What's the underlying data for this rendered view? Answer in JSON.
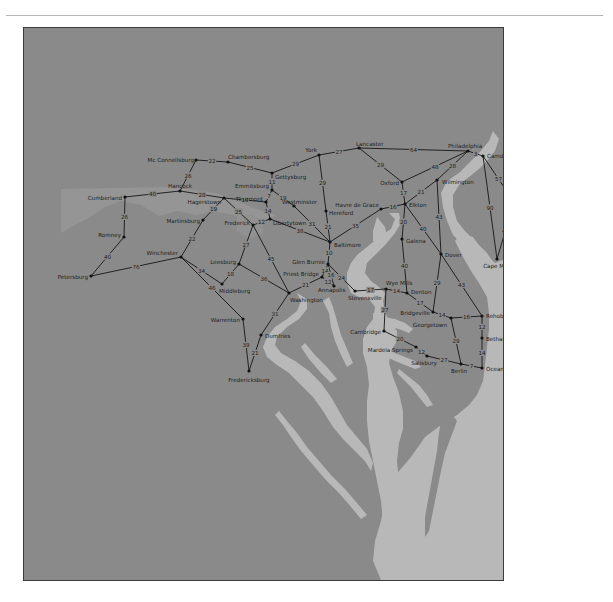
{
  "map": {
    "title": "Road distance map — Mid-Atlantic region",
    "colors": {
      "land_main": "#8a8a8a",
      "land_light": "#959595",
      "water": "#b8b8b8",
      "road": "#151515",
      "text": "#1d1d1d",
      "frame": "#3c3c3c"
    },
    "cities": [
      {
        "id": "mcconnellsburg",
        "name": "Mc Connellsburg",
        "x": 195,
        "y": 159,
        "lx": -2,
        "ly": 0,
        "anchor": "end"
      },
      {
        "id": "chamberburg",
        "name": "Chambersburg",
        "x": 227,
        "y": 161,
        "lx": 0,
        "ly": -5,
        "anchor": "start"
      },
      {
        "id": "gettysburg",
        "name": "Gettysburg",
        "x": 271,
        "y": 172,
        "lx": 3,
        "ly": 4,
        "anchor": "start"
      },
      {
        "id": "york",
        "name": "York",
        "x": 318,
        "y": 154,
        "lx": -2,
        "ly": -5,
        "anchor": "end"
      },
      {
        "id": "lancaster",
        "name": "Lancaster",
        "x": 358,
        "y": 147,
        "lx": -3,
        "ly": -4,
        "anchor": "start"
      },
      {
        "id": "philadelphia",
        "name": "Philadelphia",
        "x": 467,
        "y": 150,
        "lx": -20,
        "ly": -5,
        "anchor": "start"
      },
      {
        "id": "camden",
        "name": "Camden",
        "x": 482,
        "y": 155,
        "lx": 4,
        "ly": 0,
        "anchor": "start"
      },
      {
        "id": "hancock",
        "name": "Hancock",
        "x": 179,
        "y": 190,
        "lx": -12,
        "ly": -5,
        "anchor": "start"
      },
      {
        "id": "cumberland",
        "name": "Cumberland",
        "x": 124,
        "y": 196,
        "lx": -3,
        "ly": 1,
        "anchor": "end"
      },
      {
        "id": "hagerstown",
        "name": "Hagerstown",
        "x": 223,
        "y": 197,
        "lx": -3,
        "ly": 4,
        "anchor": "end"
      },
      {
        "id": "emmitsburg",
        "name": "Emmitsburg",
        "x": 271,
        "y": 189,
        "lx": -3,
        "ly": -4,
        "anchor": "end"
      },
      {
        "id": "thurmont",
        "name": "Thurmont",
        "x": 265,
        "y": 201,
        "lx": -3,
        "ly": -3,
        "anchor": "end"
      },
      {
        "id": "westminster",
        "name": "Westminster",
        "x": 293,
        "y": 205,
        "lx": -12,
        "ly": -4,
        "anchor": "start"
      },
      {
        "id": "oxford",
        "name": "Oxford",
        "x": 401,
        "y": 181,
        "lx": -3,
        "ly": 1,
        "anchor": "end"
      },
      {
        "id": "wilmington",
        "name": "Wilmington",
        "x": 436,
        "y": 179,
        "lx": 5,
        "ly": 2,
        "anchor": "start"
      },
      {
        "id": "atlanticcity",
        "name": "Atlantic City",
        "x": 513,
        "y": 201,
        "lx": 3,
        "ly": 1,
        "anchor": "start"
      },
      {
        "id": "hereford",
        "name": "Hereford",
        "x": 325,
        "y": 210,
        "lx": 3,
        "ly": 2,
        "anchor": "start"
      },
      {
        "id": "havredegrace",
        "name": "Havre de Grace",
        "x": 380,
        "y": 208,
        "lx": -2,
        "ly": -4,
        "anchor": "end"
      },
      {
        "id": "elkton",
        "name": "Elkton",
        "x": 404,
        "y": 203,
        "lx": 4,
        "ly": 1,
        "anchor": "start"
      },
      {
        "id": "martinsburg",
        "name": "Martinsburg",
        "x": 202,
        "y": 219,
        "lx": -3,
        "ly": 1,
        "anchor": "end"
      },
      {
        "id": "frederick",
        "name": "Frederick",
        "x": 252,
        "y": 224,
        "lx": -3,
        "ly": -2,
        "anchor": "end"
      },
      {
        "id": "libertytown",
        "name": "Libertytown",
        "x": 269,
        "y": 218,
        "lx": 3,
        "ly": 4,
        "anchor": "start"
      },
      {
        "id": "romney",
        "name": "Romney",
        "x": 123,
        "y": 236,
        "lx": -3,
        "ly": -2,
        "anchor": "end"
      },
      {
        "id": "baltimore",
        "name": "Baltimore",
        "x": 329,
        "y": 241,
        "lx": 4,
        "ly": 3,
        "anchor": "start"
      },
      {
        "id": "galena",
        "name": "Galena",
        "x": 401,
        "y": 238,
        "lx": 4,
        "ly": 2,
        "anchor": "start"
      },
      {
        "id": "winchester",
        "name": "Winchester",
        "x": 180,
        "y": 256,
        "lx": -3,
        "ly": -4,
        "anchor": "end"
      },
      {
        "id": "leesburg",
        "name": "Leesburg",
        "x": 238,
        "y": 263,
        "lx": -3,
        "ly": -2,
        "anchor": "end"
      },
      {
        "id": "dover",
        "name": "Dover",
        "x": 440,
        "y": 253,
        "lx": 4,
        "ly": 1,
        "anchor": "start"
      },
      {
        "id": "glenburnie",
        "name": "Glen Burnie",
        "x": 327,
        "y": 263,
        "lx": -3,
        "ly": -2,
        "anchor": "end"
      },
      {
        "id": "petersburg",
        "name": "Petersburg",
        "x": 90,
        "y": 275,
        "lx": -3,
        "ly": 1,
        "anchor": "end"
      },
      {
        "id": "capemay",
        "name": "Cape May",
        "x": 496,
        "y": 258,
        "lx": 0,
        "ly": 7,
        "anchor": "middle"
      },
      {
        "id": "middleburg",
        "name": "Middleburg",
        "x": 221,
        "y": 283,
        "lx": -3,
        "ly": 7,
        "anchor": "start"
      },
      {
        "id": "priestbridge",
        "name": "Priest Bridge",
        "x": 321,
        "y": 276,
        "lx": -3,
        "ly": -3,
        "anchor": "end"
      },
      {
        "id": "annapolis",
        "name": "Annapolis",
        "x": 333,
        "y": 285,
        "lx": -16,
        "ly": 4,
        "anchor": "start"
      },
      {
        "id": "wyemills",
        "name": "Wye Mills",
        "x": 385,
        "y": 288,
        "lx": 0,
        "ly": -6,
        "anchor": "start"
      },
      {
        "id": "stevensville",
        "name": "Stevensville",
        "x": 354,
        "y": 290,
        "lx": -7,
        "ly": 7,
        "anchor": "start"
      },
      {
        "id": "denton",
        "name": "Denton",
        "x": 406,
        "y": 292,
        "lx": 4,
        "ly": -1,
        "anchor": "start"
      },
      {
        "id": "washington",
        "name": "Washington",
        "x": 288,
        "y": 292,
        "lx": 1,
        "ly": 7,
        "anchor": "start"
      },
      {
        "id": "bridgeville",
        "name": "Bridgeville",
        "x": 432,
        "y": 311,
        "lx": -3,
        "ly": 1,
        "anchor": "end"
      },
      {
        "id": "georgetown",
        "name": "Georgetown",
        "x": 450,
        "y": 317,
        "lx": -4,
        "ly": 7,
        "anchor": "end"
      },
      {
        "id": "rehobothbeach",
        "name": "Rehoboth Beach",
        "x": 481,
        "y": 315,
        "lx": 4,
        "ly": 0,
        "anchor": "start"
      },
      {
        "id": "warrenton",
        "name": "Warrenton",
        "x": 242,
        "y": 318,
        "lx": -3,
        "ly": 1,
        "anchor": "end"
      },
      {
        "id": "cambridge",
        "name": "Cambridge",
        "x": 383,
        "y": 330,
        "lx": -3,
        "ly": 1,
        "anchor": "end"
      },
      {
        "id": "bethanybeach",
        "name": "Bethany Beach",
        "x": 481,
        "y": 337,
        "lx": 4,
        "ly": 1,
        "anchor": "start"
      },
      {
        "id": "dumfries",
        "name": "Dumfries",
        "x": 260,
        "y": 334,
        "lx": 4,
        "ly": 1,
        "anchor": "start"
      },
      {
        "id": "mardelasprings",
        "name": "Mardela Springs",
        "x": 415,
        "y": 346,
        "lx": -3,
        "ly": 3,
        "anchor": "end"
      },
      {
        "id": "salisbury",
        "name": "Salisbury",
        "x": 426,
        "y": 355,
        "lx": -3,
        "ly": 7,
        "anchor": "middle"
      },
      {
        "id": "berlin",
        "name": "Berlin",
        "x": 460,
        "y": 363,
        "lx": -2,
        "ly": 7,
        "anchor": "middle"
      },
      {
        "id": "oceancity",
        "name": "Ocean City",
        "x": 481,
        "y": 367,
        "lx": 4,
        "ly": 1,
        "anchor": "start"
      },
      {
        "id": "fredericksburg",
        "name": "Fredericksburg",
        "x": 248,
        "y": 370,
        "lx": 0,
        "ly": 9,
        "anchor": "middle"
      }
    ],
    "roads": [
      {
        "from": "mcconnellsburg",
        "to": "chamberburg",
        "miles": "22"
      },
      {
        "from": "chamberburg",
        "to": "gettysburg",
        "miles": "25"
      },
      {
        "from": "gettysburg",
        "to": "york",
        "miles": "29"
      },
      {
        "from": "york",
        "to": "lancaster",
        "miles": "27"
      },
      {
        "from": "lancaster",
        "to": "philadelphia",
        "miles": "64"
      },
      {
        "from": "philadelphia",
        "to": "camden",
        "miles": "3"
      },
      {
        "from": "mcconnellsburg",
        "to": "hancock",
        "miles": "26"
      },
      {
        "from": "cumberland",
        "to": "hancock",
        "miles": "40"
      },
      {
        "from": "hancock",
        "to": "hagerstown",
        "miles": "28"
      },
      {
        "from": "gettysburg",
        "to": "emmitsburg",
        "miles": "11"
      },
      {
        "from": "hagerstown",
        "to": "thurmont",
        "miles": "19"
      },
      {
        "from": "emmitsburg",
        "to": "thurmont",
        "miles": "7"
      },
      {
        "from": "emmitsburg",
        "to": "westminster",
        "miles": "19"
      },
      {
        "from": "thurmont",
        "to": "libertytown",
        "miles": "14"
      },
      {
        "from": "york",
        "to": "hereford",
        "miles": "29"
      },
      {
        "from": "hereford",
        "to": "baltimore",
        "miles": "21"
      },
      {
        "from": "westminster",
        "to": "baltimore",
        "miles": "31"
      },
      {
        "from": "libertytown",
        "to": "baltimore",
        "miles": "38"
      },
      {
        "from": "lancaster",
        "to": "oxford",
        "miles": "29"
      },
      {
        "from": "oxford",
        "to": "philadelphia",
        "miles": "48"
      },
      {
        "from": "oxford",
        "to": "elkton",
        "miles": "17"
      },
      {
        "from": "wilmington",
        "to": "philadelphia",
        "miles": "28"
      },
      {
        "from": "elkton",
        "to": "wilmington",
        "miles": "21"
      },
      {
        "from": "havredegrace",
        "to": "elkton",
        "miles": "16"
      },
      {
        "from": "baltimore",
        "to": "havredegrace",
        "miles": "35"
      },
      {
        "from": "camden",
        "to": "atlanticcity",
        "miles": "57"
      },
      {
        "from": "camden",
        "to": "capemay",
        "miles": "90"
      },
      {
        "from": "atlanticcity",
        "to": "capemay",
        "miles": "43"
      },
      {
        "from": "cumberland",
        "to": "romney",
        "miles": "26"
      },
      {
        "from": "hagerstown",
        "to": "martinsburg",
        "miles": "19"
      },
      {
        "from": "hagerstown",
        "to": "frederick",
        "miles": "25"
      },
      {
        "from": "frederick",
        "to": "libertytown",
        "miles": "12"
      },
      {
        "from": "romney",
        "to": "petersburg",
        "miles": "40"
      },
      {
        "from": "martinsburg",
        "to": "winchester",
        "miles": "22"
      },
      {
        "from": "petersburg",
        "to": "winchester",
        "miles": "76"
      },
      {
        "from": "frederick",
        "to": "leesburg",
        "miles": "27"
      },
      {
        "from": "frederick",
        "to": "washington",
        "miles": "45"
      },
      {
        "from": "winchester",
        "to": "middleburg",
        "miles": "34"
      },
      {
        "from": "leesburg",
        "to": "middleburg",
        "miles": "18"
      },
      {
        "from": "leesburg",
        "to": "washington",
        "miles": "36"
      },
      {
        "from": "winchester",
        "to": "warrenton",
        "miles": "46"
      },
      {
        "from": "elkton",
        "to": "galena",
        "miles": "20"
      },
      {
        "from": "elkton",
        "to": "dover",
        "miles": "40"
      },
      {
        "from": "wilmington",
        "to": "dover",
        "miles": "43"
      },
      {
        "from": "galena",
        "to": "denton",
        "miles": "40"
      },
      {
        "from": "baltimore",
        "to": "glenburnie",
        "miles": "10"
      },
      {
        "from": "glenburnie",
        "to": "priestbridge",
        "miles": "14"
      },
      {
        "from": "glenburnie",
        "to": "annapolis",
        "miles": "16"
      },
      {
        "from": "glenburnie",
        "to": "stevensville",
        "miles": "24"
      },
      {
        "from": "priestbridge",
        "to": "annapolis",
        "miles": "12"
      },
      {
        "from": "washington",
        "to": "priestbridge",
        "miles": "21"
      },
      {
        "from": "stevensville",
        "to": "wyemills",
        "miles": "17"
      },
      {
        "from": "wyemills",
        "to": "denton",
        "miles": "14"
      },
      {
        "from": "denton",
        "to": "bridgeville",
        "miles": "17"
      },
      {
        "from": "dover",
        "to": "bridgeville",
        "miles": "29"
      },
      {
        "from": "dover",
        "to": "rehobothbeach",
        "miles": "43"
      },
      {
        "from": "bridgeville",
        "to": "georgetown",
        "miles": "14"
      },
      {
        "from": "georgetown",
        "to": "rehobothbeach",
        "miles": "16"
      },
      {
        "from": "rehobothbeach",
        "to": "bethanybeach",
        "miles": "12"
      },
      {
        "from": "bethanybeach",
        "to": "oceancity",
        "miles": "14"
      },
      {
        "from": "wyemills",
        "to": "cambridge",
        "miles": "27"
      },
      {
        "from": "cambridge",
        "to": "mardelasprings",
        "miles": "20"
      },
      {
        "from": "mardelasprings",
        "to": "salisbury",
        "miles": "12"
      },
      {
        "from": "salisbury",
        "to": "berlin",
        "miles": "27"
      },
      {
        "from": "georgetown",
        "to": "berlin",
        "miles": "29"
      },
      {
        "from": "berlin",
        "to": "oceancity",
        "miles": "7"
      },
      {
        "from": "washington",
        "to": "dumfries",
        "miles": "31"
      },
      {
        "from": "dumfries",
        "to": "fredericksburg",
        "miles": "21"
      },
      {
        "from": "warrenton",
        "to": "fredericksburg",
        "miles": "39"
      }
    ]
  }
}
